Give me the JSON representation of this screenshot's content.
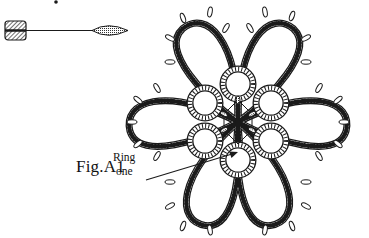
{
  "figure": {
    "label": "Fig.A1",
    "callout": {
      "line1": "Ring",
      "line2": "one"
    },
    "legend_icon": "shuttle-and-thread-icon",
    "colors": {
      "ink": "#1a1a1a",
      "background": "#ffffff"
    }
  }
}
